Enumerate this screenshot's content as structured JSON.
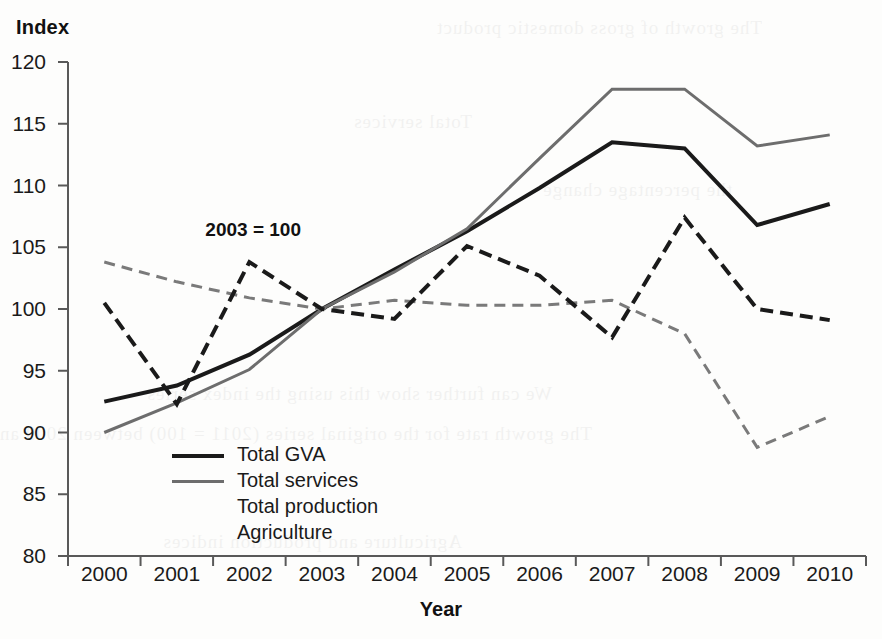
{
  "chart_data": {
    "type": "line",
    "title": "",
    "xlabel": "Year",
    "ylabel": "Index",
    "annotation": "2003 = 100",
    "x": [
      2000,
      2001,
      2002,
      2003,
      2004,
      2005,
      2006,
      2007,
      2008,
      2009,
      2010
    ],
    "categories": [
      "2000",
      "2001",
      "2002",
      "2003",
      "2004",
      "2005",
      "2006",
      "2007",
      "2008",
      "2009",
      "2010"
    ],
    "ylim": [
      80,
      120
    ],
    "yticks": [
      80,
      85,
      90,
      95,
      100,
      105,
      110,
      115,
      120
    ],
    "ytick_labels": [
      "80",
      "85",
      "90",
      "95",
      "100",
      "105",
      "110",
      "115",
      "120"
    ],
    "xtick_labels": [
      "2000",
      "2001",
      "2002",
      "2003",
      "2004",
      "2005",
      "2006",
      "2007",
      "2008",
      "2009",
      "2010"
    ],
    "grid": false,
    "legend_position": "inside lower-left",
    "series": [
      {
        "name": "Total GVA",
        "style": "solid",
        "color": "#1a1a1a",
        "width": 4,
        "values": [
          92.5,
          93.8,
          96.3,
          100.0,
          103.2,
          106.3,
          109.8,
          113.5,
          113.0,
          106.8,
          108.5
        ]
      },
      {
        "name": "Total services",
        "style": "solid",
        "color": "#6d6d6d",
        "width": 3,
        "values": [
          90.0,
          92.4,
          95.1,
          100.0,
          103.0,
          106.5,
          112.2,
          117.8,
          117.8,
          113.2,
          114.1
        ]
      },
      {
        "name": "Total production",
        "style": "dashed",
        "color": "#7a7a7a",
        "width": 3,
        "values": [
          103.8,
          102.2,
          100.9,
          100.0,
          100.7,
          100.3,
          100.3,
          100.7,
          98.0,
          88.8,
          91.3
        ]
      },
      {
        "name": "Agriculture",
        "style": "dashed",
        "color": "#1a1a1a",
        "width": 4,
        "values": [
          100.5,
          92.3,
          103.8,
          100.0,
          99.2,
          105.1,
          102.7,
          97.7,
          107.4,
          100.0,
          99.1
        ]
      }
    ]
  },
  "axes": {
    "y_title": "Index",
    "x_title": "Year"
  },
  "legend": {
    "items": [
      {
        "label": "Total GVA"
      },
      {
        "label": "Total services"
      },
      {
        "label": "Total production"
      },
      {
        "label": "Agriculture"
      }
    ]
  },
  "annotation": {
    "text": "2003 = 100"
  },
  "bleed_text": {
    "lines": [
      "The growth of gross domestic product",
      "We can further show this using the index series",
      "The growth rate for the original series (2011 = 100) between 2009 and 2010",
      "the percentage change",
      "Total services",
      "Agriculture and production indices"
    ]
  }
}
